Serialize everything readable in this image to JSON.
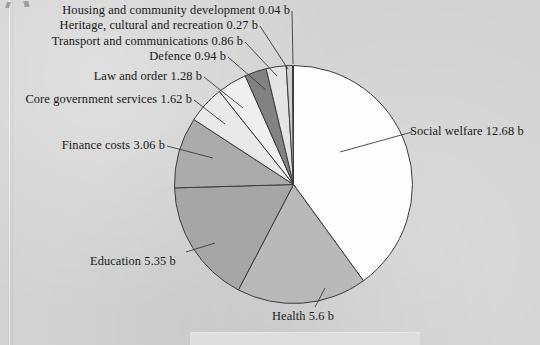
{
  "chart_data": {
    "type": "pie",
    "title": "",
    "subtitle": "",
    "xlabel": "",
    "ylabel": "",
    "units": "b",
    "total": 32.7,
    "legend_position": "callout-labels",
    "grid": false,
    "start_angle_deg": 0,
    "direction": "clockwise",
    "categories": [
      "Social welfare",
      "Health",
      "Education",
      "Finance costs",
      "Core government services",
      "Law and order",
      "Defence",
      "Transport and communications",
      "Heritage, cultural and recreation",
      "Housing and community development"
    ],
    "values": [
      12.68,
      5.6,
      5.35,
      3.06,
      1.62,
      1.28,
      0.94,
      0.86,
      0.27,
      0.04
    ],
    "slices": [
      {
        "label": "Social welfare 12.68 b",
        "name": "Social welfare",
        "value": 12.68,
        "color": "#fdfdfd"
      },
      {
        "label": "Health 5.6 b",
        "name": "Health",
        "value": 5.6,
        "color": "#b9b9b9"
      },
      {
        "label": "Education 5.35 b",
        "name": "Education",
        "value": 5.35,
        "color": "#a6a6a6"
      },
      {
        "label": "Finance costs 3.06 b",
        "name": "Finance costs",
        "value": 3.06,
        "color": "#ababab"
      },
      {
        "label": "Core government services 1.62 b",
        "name": "Core government services",
        "value": 1.62,
        "color": "#e9e9e9"
      },
      {
        "label": "Law and order 1.28 b",
        "name": "Law and order",
        "value": 1.28,
        "color": "#efefef"
      },
      {
        "label": "Defence 0.94 b",
        "name": "Defence",
        "value": 0.94,
        "color": "#828282"
      },
      {
        "label": "Transport and communications 0.86 b",
        "name": "Transport and communications",
        "value": 0.86,
        "color": "#e4e4e4"
      },
      {
        "label": "Heritage, cultural and recreation 0.27 b",
        "name": "Heritage, cultural and recreation",
        "value": 0.27,
        "color": "#cfcfcf"
      },
      {
        "label": "Housing and community development 0.04 b",
        "name": "Housing and community development",
        "value": 0.04,
        "color": "#3a3a3a"
      }
    ],
    "colors": {
      "background": "#d2d2d2",
      "outline": "#3c3c3c",
      "text": "#1b1b1b",
      "leader_line": "#3c3c3c"
    }
  }
}
